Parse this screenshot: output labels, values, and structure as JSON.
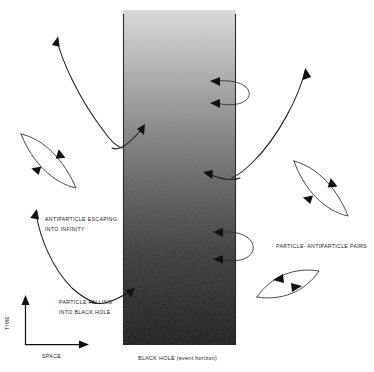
{
  "figure": {
    "background_color": "#ffffff",
    "width": 374,
    "height": 372
  },
  "black_hole": {
    "name": "black-hole-region",
    "caption": "BLACK HOLE (event horizon)",
    "gradient_top_color": "#d6d6d6",
    "gradient_bottom_color": "#151515",
    "edge_color": "#2b2b2b",
    "left_x": 123,
    "right_x": 236,
    "top_y": 10,
    "bottom_y": 345
  },
  "axes": {
    "time_label": "TIME",
    "space_label": "SPACE",
    "color": "#111111",
    "origin_x": 25,
    "origin_y": 345,
    "time_top_y": 297,
    "space_right_x": 88
  },
  "annotations": [
    {
      "id": "antiparticle-escaping",
      "lines": [
        "ANTIPARTICLE ESCAPING",
        "INTO INFINITY"
      ],
      "x": 45,
      "y": 220
    },
    {
      "id": "particle-falling",
      "lines": [
        "PARTICLE FALLING",
        "INTO BLACK HOLE"
      ],
      "x": 59,
      "y": 303
    },
    {
      "id": "particle-antiparticle-pairs",
      "lines": [
        "PARTICLE- ANTIPARTICLE PAIRS"
      ],
      "x": 276,
      "y": 247
    }
  ],
  "trajectories": [
    {
      "id": "escaping-antiparticle-upper",
      "description": "virtual pair near horizon: antiparticle escapes up-left to infinity, partner falls into black hole",
      "path": "M 57 40 C 62 62, 80 100, 103 130 C 112 143, 118 147, 122 148",
      "arrow_at": "start",
      "arrow_x": 57,
      "arrow_y": 40,
      "arrow_angle": -75
    },
    {
      "id": "infalling-partner-upper",
      "description": "partner particle curving right across the horizon",
      "path": "M 112 148 C 118 150, 126 146, 140 131",
      "arrow_at": "end",
      "arrow_x": 146,
      "arrow_y": 126,
      "arrow_angle": -45
    },
    {
      "id": "escaping-particle-right",
      "description": "particle escaping upward to the right of the horizon",
      "path": "M 305 71 C 298 96, 278 136, 252 162 C 242 172, 236 176, 232 178",
      "arrow_at": "start",
      "arrow_x": 305,
      "arrow_y": 71,
      "arrow_angle": -70
    },
    {
      "id": "infalling-partner-right",
      "description": "partner falling left into the black hole",
      "path": "M 240 177 C 232 180, 224 180, 210 175",
      "arrow_at": "end",
      "arrow_x": 204,
      "arrow_y": 173,
      "arrow_angle": 195
    },
    {
      "id": "escaping-antiparticle-lower",
      "description": "antiparticle escaping to infinity at lower left",
      "path": "M 36 213 C 40 238, 52 268, 72 288 C 82 297, 90 301, 96 303",
      "arrow_at": "start",
      "arrow_x": 36,
      "arrow_y": 213,
      "arrow_angle": -80
    },
    {
      "id": "infalling-particle-lower",
      "description": "particle falling into black hole across the horizon",
      "path": "M 90 302 C 100 305, 112 301, 128 292",
      "arrow_at": "end",
      "arrow_x": 134,
      "arrow_y": 288,
      "arrow_angle": -30
    }
  ],
  "virtual_pair_loops": [
    {
      "id": "pair-loop-left",
      "location": "outside-left",
      "path": "M 22 135 C 45 140, 65 160, 76 187 C 54 182, 33 162, 22 135 Z",
      "arrows": [
        {
          "x": 61,
          "y": 155,
          "angle": 50
        },
        {
          "x": 36,
          "y": 168,
          "angle": 230
        }
      ]
    },
    {
      "id": "pair-loop-right-upper",
      "location": "outside-right",
      "path": "M 295 162 C 318 168, 337 188, 347 215 C 325 210, 305 190, 295 162 Z",
      "arrows": [
        {
          "x": 333,
          "y": 184,
          "angle": 52
        },
        {
          "x": 308,
          "y": 196,
          "angle": 232
        }
      ]
    },
    {
      "id": "pair-loop-right-lower",
      "location": "outside-right-bottom",
      "path": "M 258 296 C 272 276, 295 268, 318 272 C 304 292, 281 300, 258 296 Z",
      "arrows": [
        {
          "x": 279,
          "y": 277,
          "angle": -32
        },
        {
          "x": 297,
          "y": 289,
          "angle": 150
        }
      ]
    },
    {
      "id": "straddling-loop-upper",
      "location": "across-horizon",
      "path": "M 217 82 C 240 80, 250 88, 248 96 C 245 104, 232 106, 217 102",
      "arrows": [
        {
          "x": 213,
          "y": 81,
          "angle": 190
        },
        {
          "x": 213,
          "y": 103,
          "angle": 192
        }
      ]
    },
    {
      "id": "straddling-loop-lower",
      "location": "across-horizon",
      "path": "M 220 233 C 243 231, 254 240, 252 250 C 249 259, 236 262, 220 258",
      "arrows": [
        {
          "x": 216,
          "y": 232,
          "angle": 190
        },
        {
          "x": 216,
          "y": 259,
          "angle": 192
        }
      ]
    }
  ]
}
